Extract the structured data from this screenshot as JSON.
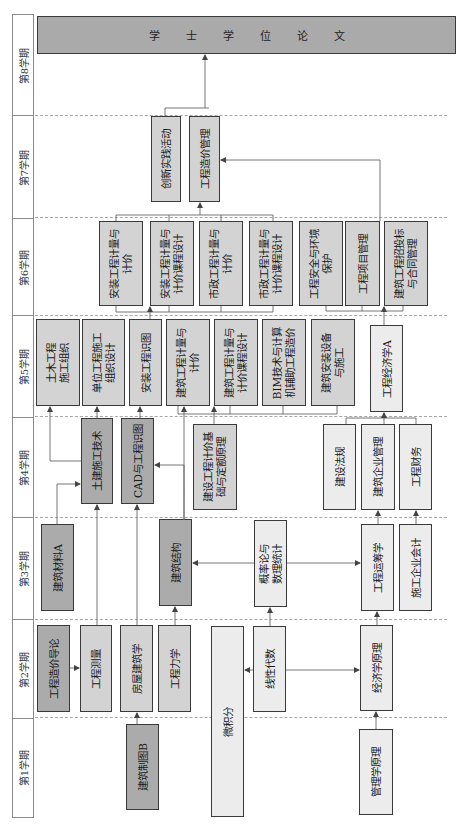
{
  "semesters": [
    {
      "id": "s8",
      "label": "第8学期"
    },
    {
      "id": "s7",
      "label": "第7学期"
    },
    {
      "id": "s6",
      "label": "第6学期"
    },
    {
      "id": "s5",
      "label": "第5学期"
    },
    {
      "id": "s4",
      "label": "第4学期"
    },
    {
      "id": "s3",
      "label": "第3学期"
    },
    {
      "id": "s2",
      "label": "第2学期"
    },
    {
      "id": "s1",
      "label": "第1学期"
    }
  ],
  "thesis": {
    "label": "学士学位论文",
    "chars": [
      "学",
      "士",
      "学",
      "位",
      "论",
      "文"
    ]
  },
  "courses": {
    "s7": [
      {
        "name": "创新实践活动",
        "shade": "mid"
      },
      {
        "name": "工程造价管理",
        "shade": "mid"
      }
    ],
    "s6": [
      {
        "name": "安装工程计量与\n计价",
        "shade": "mid"
      },
      {
        "name": "安装工程计量与\n计价课程设计",
        "shade": "mid"
      },
      {
        "name": "市政工程计量与\n计价",
        "shade": "mid"
      },
      {
        "name": "市政工程计量与\n计价课程设计",
        "shade": "mid"
      },
      {
        "name": "工程安全与环境\n保护",
        "shade": "mid"
      },
      {
        "name": "工程项目管理",
        "shade": "mid"
      },
      {
        "name": "建筑工程招投标\n与合同管理",
        "shade": "mid"
      }
    ],
    "s5": [
      {
        "name": "土木工程\n施工组织",
        "shade": "mid"
      },
      {
        "name": "单位工程施工\n组织设计",
        "shade": "mid"
      },
      {
        "name": "安装工程识图",
        "shade": "mid"
      },
      {
        "name": "建筑工程计量与\n计价",
        "shade": "mid"
      },
      {
        "name": "建筑工程计量与\n计价课程设计",
        "shade": "mid"
      },
      {
        "name": "BIM技术与计算\n机辅助工程造价",
        "shade": "mid"
      },
      {
        "name": "建筑安装设备\n与施工",
        "shade": "mid"
      },
      {
        "name": "工程经济学A",
        "shade": "light"
      }
    ],
    "s4": [
      {
        "name": "土建施工技术",
        "shade": "dark"
      },
      {
        "name": "CAD与工程识图",
        "shade": "dark"
      },
      {
        "name": "建设工程计价基\n础与定额原理",
        "shade": "mid"
      },
      {
        "name": "建设法规",
        "shade": "light"
      },
      {
        "name": "建筑企业管理",
        "shade": "light"
      },
      {
        "name": "工程财务",
        "shade": "light"
      }
    ],
    "s3": [
      {
        "name": "建筑材料A",
        "shade": "dark"
      },
      {
        "name": "建筑结构",
        "shade": "dark"
      },
      {
        "name": "概率论与\n数理统计",
        "shade": "light"
      },
      {
        "name": "工程运筹学",
        "shade": "light"
      },
      {
        "name": "施工企业会计",
        "shade": "light"
      }
    ],
    "s2": [
      {
        "name": "工程造价导论",
        "shade": "dark"
      },
      {
        "name": "工程测量",
        "shade": "mid"
      },
      {
        "name": "房屋建筑学",
        "shade": "mid"
      },
      {
        "name": "工程力学",
        "shade": "mid"
      },
      {
        "name": "线性代数",
        "shade": "light"
      },
      {
        "name": "经济学原理",
        "shade": "light"
      }
    ],
    "s1": [
      {
        "name": "建筑制图B",
        "shade": "dark"
      },
      {
        "name": "微积分",
        "shade": "light"
      },
      {
        "name": "管理学原理",
        "shade": "light"
      }
    ]
  },
  "colors": {
    "dark": "#ababab",
    "mid": "#d3d3d3",
    "light": "#ececec",
    "border": "#3a3a3a",
    "line": "#555555",
    "divider": "#a8a8a8"
  }
}
